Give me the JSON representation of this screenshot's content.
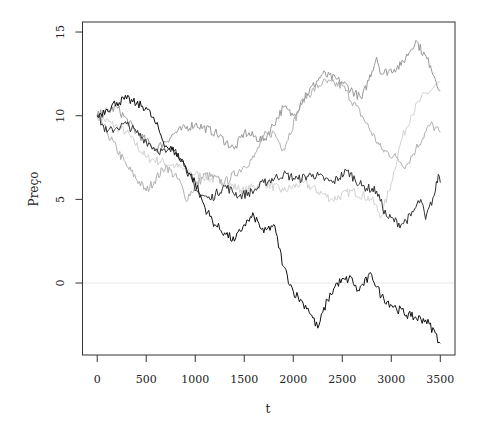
{
  "chart_data": {
    "type": "line",
    "title": "",
    "xlabel": "t",
    "ylabel": "Preço",
    "xlim": [
      -150,
      3650
    ],
    "ylim": [
      -4.3,
      15.6
    ],
    "xticks": [
      0,
      500,
      1000,
      1500,
      2000,
      2500,
      3000,
      3500
    ],
    "xtick_labels": [
      "0",
      "500",
      "1000",
      "1500",
      "2000",
      "2500",
      "3000",
      "3500"
    ],
    "yticks": [
      0,
      5,
      10,
      15
    ],
    "ytick_labels": [
      "0",
      "5",
      "10",
      "15"
    ],
    "grid": false,
    "legend": null,
    "reference_line": {
      "y": 0,
      "color": "#e6e6e6"
    },
    "series": [
      {
        "name": "path-1",
        "color": "#111111",
        "x": [
          0,
          100,
          200,
          300,
          400,
          500,
          600,
          700,
          800,
          900,
          1000,
          1100,
          1200,
          1300,
          1400,
          1500,
          1600,
          1700,
          1800,
          1900,
          2000,
          2100,
          2150,
          2250,
          2350,
          2450,
          2600,
          2650,
          2800,
          2900,
          3050,
          3200,
          3350,
          3450,
          3500
        ],
        "values": [
          10,
          10.4,
          10.8,
          11,
          10.7,
          10.5,
          9.5,
          8.2,
          7.8,
          7,
          6,
          4.5,
          3.5,
          3,
          2.5,
          3.5,
          4,
          3,
          3.5,
          1,
          -0.5,
          -1.2,
          -1.5,
          -2.7,
          -1,
          0,
          0.3,
          -0.5,
          0.5,
          -0.8,
          -1.5,
          -2,
          -2.2,
          -3,
          -3.6
        ]
      },
      {
        "name": "path-2",
        "color": "#333333",
        "x": [
          0,
          100,
          200,
          300,
          400,
          500,
          600,
          700,
          800,
          900,
          1000,
          1150,
          1300,
          1450,
          1600,
          1700,
          1900,
          2050,
          2200,
          2400,
          2550,
          2700,
          2850,
          2950,
          3100,
          3200,
          3300,
          3350,
          3450,
          3480,
          3500
        ],
        "values": [
          10,
          9,
          9.3,
          9.5,
          9,
          8.5,
          8,
          7.8,
          8,
          7,
          5.5,
          5,
          5.8,
          5.2,
          5.5,
          6,
          6.5,
          6.2,
          6.5,
          6,
          6.7,
          5.8,
          5.5,
          4,
          3.5,
          4,
          5,
          3.8,
          5.5,
          6.5,
          6
        ]
      },
      {
        "name": "path-3",
        "color": "#9a9a9a",
        "x": [
          0,
          200,
          400,
          600,
          800,
          1000,
          1200,
          1400,
          1500,
          1700,
          1900,
          2000,
          2100,
          2300,
          2500,
          2700,
          2850,
          2900,
          3100,
          3250,
          3400,
          3500
        ],
        "values": [
          10,
          10.5,
          9,
          8,
          9,
          9.5,
          9,
          8,
          9,
          8.5,
          10.5,
          10,
          11,
          12.5,
          12,
          11,
          13.5,
          12.5,
          13,
          14.5,
          13,
          11.5
        ]
      },
      {
        "name": "path-4",
        "color": "#b0b0b0",
        "x": [
          0,
          100,
          300,
          500,
          700,
          850,
          900,
          1100,
          1300,
          1500,
          1600,
          1700,
          1800,
          1900,
          2100,
          2300,
          2500,
          2700,
          2900,
          3050,
          3150,
          3250,
          3400,
          3500
        ],
        "values": [
          10,
          9,
          7,
          5.5,
          7,
          6,
          5,
          6.5,
          6,
          7,
          7.5,
          8.8,
          9,
          8,
          11,
          12,
          11.8,
          10,
          8,
          7.5,
          7,
          8,
          9.5,
          9
        ]
      },
      {
        "name": "path-5",
        "color": "#d2d2d2",
        "x": [
          0,
          300,
          500,
          800,
          1000,
          1300,
          1500,
          1700,
          1900,
          2100,
          2400,
          2600,
          2800,
          2900,
          3000,
          3100,
          3200,
          3300,
          3400,
          3500
        ],
        "values": [
          10,
          9,
          7.5,
          7,
          6.5,
          6,
          5.5,
          6,
          5.5,
          6,
          5,
          5.5,
          5,
          4,
          6,
          8.5,
          10,
          11,
          11.5,
          12
        ]
      }
    ]
  }
}
